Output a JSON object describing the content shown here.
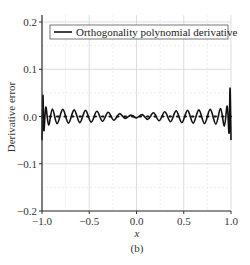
{
  "chart_data": {
    "type": "line",
    "title": "",
    "xlabel": "x",
    "ylabel": "Derivative error",
    "caption": "(b)",
    "xlim": [
      -1.0,
      1.0
    ],
    "ylim": [
      -0.2,
      0.2
    ],
    "xticks": [
      -1.0,
      -0.5,
      0.0,
      0.5,
      1.0
    ],
    "xtick_labels": [
      "−1.0",
      "−0.5",
      "0.0",
      "0.5",
      "1.0"
    ],
    "yticks": [
      -0.2,
      -0.1,
      0.0,
      0.1,
      0.2
    ],
    "ytick_labels": [
      "−0.2",
      "−0.1",
      "0.0",
      "0.1",
      "0.2"
    ],
    "grid": true,
    "legend": {
      "position": "upper center",
      "entries": [
        "Orthogonality polynomial derivative"
      ]
    },
    "series": [
      {
        "name": "Orthogonality polynomial derivative",
        "style": "solid",
        "color": "#111111",
        "description": "oscillating error around 0 with amplitude ~0.015 in interior, growing to ~0.05-0.06 spikes at x=-1 and x=1",
        "x": [
          -1.0,
          -0.99,
          -0.98,
          -0.96,
          -0.93,
          -0.89,
          -0.84,
          -0.78,
          -0.72,
          -0.66,
          -0.6,
          -0.54,
          -0.48,
          -0.42,
          -0.36,
          -0.3,
          -0.24,
          -0.18,
          -0.12,
          -0.06,
          0.0,
          0.06,
          0.12,
          0.18,
          0.24,
          0.3,
          0.36,
          0.42,
          0.48,
          0.54,
          0.6,
          0.66,
          0.72,
          0.78,
          0.84,
          0.89,
          0.93,
          0.96,
          0.98,
          0.99,
          1.0
        ],
        "y": [
          -0.05,
          0.045,
          -0.03,
          0.02,
          -0.018,
          0.016,
          -0.015,
          0.015,
          -0.014,
          0.014,
          -0.013,
          0.013,
          -0.012,
          0.011,
          -0.01,
          0.009,
          -0.008,
          0.006,
          -0.004,
          0.003,
          -0.003,
          0.004,
          -0.006,
          0.008,
          -0.009,
          0.01,
          -0.011,
          0.012,
          -0.013,
          0.013,
          -0.014,
          0.014,
          -0.015,
          0.015,
          -0.016,
          0.017,
          -0.02,
          0.022,
          -0.035,
          0.06,
          -0.05
        ]
      },
      {
        "name": "zero reference",
        "style": "dotted",
        "color": "#111111",
        "x": [
          -1.0,
          1.0
        ],
        "y": [
          0.0,
          0.0
        ]
      }
    ]
  }
}
